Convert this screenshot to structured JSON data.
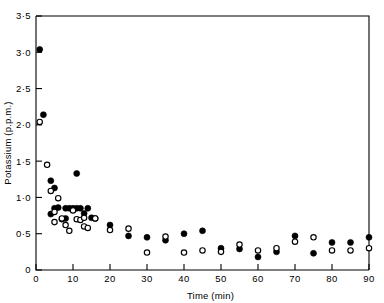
{
  "chart_data": {
    "type": "scatter",
    "title": "",
    "xlabel": "Time (min)",
    "ylabel": "Potassium (p.p.m.)",
    "xlim": [
      0,
      90
    ],
    "ylim": [
      0,
      3.5
    ],
    "grid": false,
    "legend": null,
    "xticks": [
      0,
      10,
      20,
      30,
      40,
      50,
      60,
      70,
      80,
      90
    ],
    "xticklabels": [
      "0",
      "10",
      "20",
      "30",
      "40",
      "50",
      "60",
      "70",
      "80",
      "90"
    ],
    "yticks": [
      0,
      0.5,
      1.0,
      1.5,
      2.0,
      2.5,
      3.0,
      3.5
    ],
    "yticklabels": [
      "0",
      "0·5",
      "1·0",
      "1·5",
      "2·0",
      "2·5",
      "3·0",
      "3·5"
    ],
    "series": [
      {
        "name": "filled-circles",
        "marker": "filled-circle",
        "color": "#000000",
        "points": [
          {
            "x": 1,
            "y": 3.04
          },
          {
            "x": 2,
            "y": 2.14
          },
          {
            "x": 4,
            "y": 1.23
          },
          {
            "x": 4,
            "y": 0.77
          },
          {
            "x": 5,
            "y": 1.13
          },
          {
            "x": 5,
            "y": 0.85
          },
          {
            "x": 6,
            "y": 0.86
          },
          {
            "x": 7,
            "y": 0.7
          },
          {
            "x": 8,
            "y": 0.71
          },
          {
            "x": 8,
            "y": 0.85
          },
          {
            "x": 9,
            "y": 0.85
          },
          {
            "x": 10,
            "y": 0.85
          },
          {
            "x": 11,
            "y": 1.33
          },
          {
            "x": 11,
            "y": 0.85
          },
          {
            "x": 12,
            "y": 0.85
          },
          {
            "x": 13,
            "y": 0.78
          },
          {
            "x": 14,
            "y": 0.85
          },
          {
            "x": 15,
            "y": 0.72
          },
          {
            "x": 16,
            "y": 0.71
          },
          {
            "x": 20,
            "y": 0.62
          },
          {
            "x": 25,
            "y": 0.47
          },
          {
            "x": 30,
            "y": 0.45
          },
          {
            "x": 35,
            "y": 0.41
          },
          {
            "x": 40,
            "y": 0.5
          },
          {
            "x": 45,
            "y": 0.54
          },
          {
            "x": 50,
            "y": 0.3
          },
          {
            "x": 55,
            "y": 0.29
          },
          {
            "x": 60,
            "y": 0.18
          },
          {
            "x": 65,
            "y": 0.25
          },
          {
            "x": 70,
            "y": 0.47
          },
          {
            "x": 75,
            "y": 0.23
          },
          {
            "x": 80,
            "y": 0.38
          },
          {
            "x": 85,
            "y": 0.38
          },
          {
            "x": 90,
            "y": 0.45
          }
        ]
      },
      {
        "name": "open-circles",
        "marker": "open-circle",
        "color": "#000000",
        "points": [
          {
            "x": 1,
            "y": 2.04
          },
          {
            "x": 3,
            "y": 1.45
          },
          {
            "x": 4,
            "y": 1.09
          },
          {
            "x": 5,
            "y": 0.8
          },
          {
            "x": 5,
            "y": 0.66
          },
          {
            "x": 6,
            "y": 0.99
          },
          {
            "x": 7,
            "y": 0.71
          },
          {
            "x": 8,
            "y": 0.62
          },
          {
            "x": 9,
            "y": 0.54
          },
          {
            "x": 10,
            "y": 0.82
          },
          {
            "x": 11,
            "y": 0.7
          },
          {
            "x": 12,
            "y": 0.69
          },
          {
            "x": 13,
            "y": 0.72
          },
          {
            "x": 13,
            "y": 0.6
          },
          {
            "x": 14,
            "y": 0.58
          },
          {
            "x": 16,
            "y": 0.71
          },
          {
            "x": 20,
            "y": 0.55
          },
          {
            "x": 25,
            "y": 0.57
          },
          {
            "x": 30,
            "y": 0.24
          },
          {
            "x": 35,
            "y": 0.46
          },
          {
            "x": 40,
            "y": 0.24
          },
          {
            "x": 45,
            "y": 0.27
          },
          {
            "x": 50,
            "y": 0.25
          },
          {
            "x": 55,
            "y": 0.35
          },
          {
            "x": 60,
            "y": 0.27
          },
          {
            "x": 65,
            "y": 0.3
          },
          {
            "x": 70,
            "y": 0.39
          },
          {
            "x": 75,
            "y": 0.45
          },
          {
            "x": 80,
            "y": 0.27
          },
          {
            "x": 85,
            "y": 0.27
          },
          {
            "x": 90,
            "y": 0.3
          }
        ]
      }
    ]
  }
}
